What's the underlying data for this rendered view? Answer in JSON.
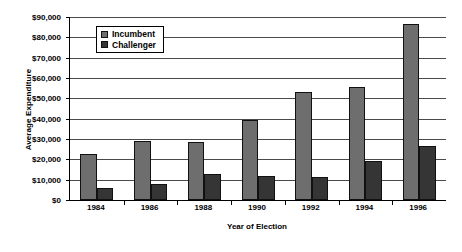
{
  "chart_data": {
    "type": "bar",
    "title": "",
    "xlabel": "Year of Election",
    "ylabel": "Average Expenditure",
    "categories": [
      "1984",
      "1986",
      "1988",
      "1990",
      "1992",
      "1994",
      "1996"
    ],
    "series": [
      {
        "name": "Incumbent",
        "color": "#6e6e6e",
        "values": [
          22500,
          29000,
          28500,
          39500,
          53000,
          55500,
          86500
        ]
      },
      {
        "name": "Challenger",
        "color": "#353535",
        "values": [
          6000,
          8000,
          13000,
          12000,
          11500,
          19000,
          26500
        ]
      }
    ],
    "ylim": [
      0,
      90000
    ],
    "ytick_values": [
      0,
      10000,
      20000,
      30000,
      40000,
      50000,
      60000,
      70000,
      80000,
      90000
    ],
    "ytick_labels": [
      "$0",
      "$10,000",
      "$20,000",
      "$30,000",
      "$40,000",
      "$50,000",
      "$60,000",
      "$70,000",
      "$80,000",
      "$90,000"
    ],
    "grid": true,
    "grid_axis": "y",
    "legend_position": "upper-left-inside",
    "legend_entries": [
      "Incumbent",
      "Challenger"
    ]
  }
}
